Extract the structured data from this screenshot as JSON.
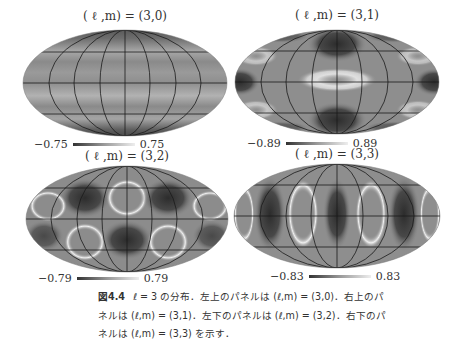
{
  "figure": {
    "number": "図4.4",
    "caption_lines": [
      "ℓ = 3 の分布．左上のパネルは (ℓ,m) = (3,0)．右上のパ",
      "ネルは (ℓ,m) = (3,1)．左下のパネルは (ℓ,m) = (3,2)．右下のパ",
      "ネルは (ℓ,m) = (3,3) を示す．"
    ]
  },
  "panels": [
    {
      "id": "top-left",
      "title": "( ℓ ,m) = (3,0)",
      "ell": 3,
      "m": 0,
      "cmin": "−0.75",
      "cmax": "0.75"
    },
    {
      "id": "top-right",
      "title": "( ℓ ,m) = (3,1)",
      "ell": 3,
      "m": 1,
      "cmin": "−0.89",
      "cmax": "0.89"
    },
    {
      "id": "bottom-left",
      "title": "( ℓ ,m) = (3,2)",
      "ell": 3,
      "m": 2,
      "cmin": "−0.79",
      "cmax": "0.79"
    },
    {
      "id": "bottom-right",
      "title": "( ℓ ,m) = (3,3)",
      "ell": 3,
      "m": 3,
      "cmin": "−0.83",
      "cmax": "0.83"
    }
  ],
  "colors": {
    "map_mid": "#8c8c8c",
    "map_low": "#3a3a3a",
    "map_high": "#f2f2f2",
    "grid": "#1a1a1a"
  }
}
